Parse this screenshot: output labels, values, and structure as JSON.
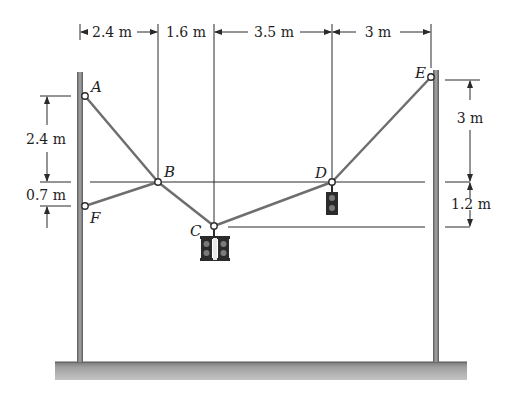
{
  "figure": {
    "type": "statics cable diagram",
    "points": {
      "A": "A",
      "B": "B",
      "C": "C",
      "D": "D",
      "E": "E",
      "F": "F"
    },
    "horizontal_dimensions": [
      "2.4 m",
      "1.6 m",
      "3.5 m",
      "3 m"
    ],
    "left_vertical_dimensions": [
      "2.4 m",
      "0.7 m"
    ],
    "right_vertical_dimensions": [
      "3 m",
      "1.2 m"
    ],
    "colors": {
      "cable": "#6e6e6e",
      "pole": "#8a8a8a",
      "ground": "#a8a8a8",
      "dimension_line": "#2a2a2a",
      "signal_body": "#2b2b2b",
      "signal_lamp": "#7a7a7a"
    },
    "objects": [
      "traffic-signal-double at C",
      "traffic-signal-single at D"
    ]
  }
}
